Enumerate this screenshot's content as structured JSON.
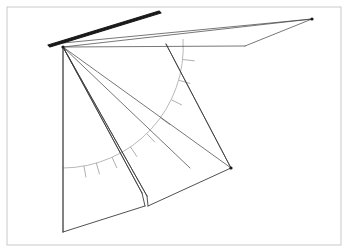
{
  "document": {
    "title": "Perspective line drawing — folded planes with angle arc",
    "width": 348,
    "height": 252,
    "background_color": "#ffffff"
  },
  "frame": {
    "name": "image-border",
    "x": 7,
    "y": 7,
    "width": 334,
    "height": 238,
    "stroke_color": "#c9c9c9",
    "stroke_width": 1,
    "fill": "#ffffff"
  },
  "style": {
    "ink_dark": "#1a1a1a",
    "ink_mid": "#3c3c3c",
    "ink_light": "#8f8f8f",
    "ink_faint": "#b0b0b0",
    "thin_width": 0.7,
    "medium_width": 0.9,
    "thick_width": 1.7
  },
  "geometry": {
    "apex": {
      "name": "apex-vertex",
      "x": 63,
      "y": 47
    },
    "right_vertex": {
      "name": "right-wing-vertex",
      "x": 312,
      "y": 19
    },
    "lower_right_vertex": {
      "name": "lower-right-vertex",
      "x": 231,
      "y": 168
    },
    "bottom_left_vertex": {
      "name": "bottom-left-vertex",
      "x": 63,
      "y": 232
    },
    "rod": {
      "name": "thick-rod",
      "points": "48,45 159,11 161,13 50,47",
      "stroke_color": "#1a1a1a",
      "stroke_width": 1.1
    },
    "upper_wing": {
      "name": "upper-wing-panel",
      "points": "63,47 312,19 245,46 63,43",
      "stroke_color": "#3c3c3c",
      "stroke_width": 0.8
    },
    "upper_wing_extra_edges": [
      {
        "name": "wing-edge-top",
        "x1": 63,
        "y1": 43,
        "x2": 312,
        "y2": 19
      },
      {
        "name": "wing-edge-mid",
        "x1": 63,
        "y1": 47,
        "x2": 312,
        "y2": 19
      },
      {
        "name": "wing-edge-lower",
        "x1": 63,
        "y1": 47,
        "x2": 245,
        "y2": 46
      },
      {
        "name": "wing-edge-bottom",
        "x1": 245,
        "y1": 46,
        "x2": 312,
        "y2": 19
      }
    ],
    "left_panel": {
      "name": "left-vertical-panel",
      "points": "63,47 63,232 145,206 142,193",
      "stroke_color": "#3c3c3c",
      "stroke_width": 0.8
    },
    "left_panel_edges": [
      {
        "name": "left-panel-vertical-edge",
        "x1": 63,
        "y1": 47,
        "x2": 63,
        "y2": 232
      },
      {
        "name": "left-panel-bottom-edge",
        "x1": 63,
        "y1": 232,
        "x2": 145,
        "y2": 206
      },
      {
        "name": "left-panel-notch-edge",
        "x1": 145,
        "y1": 206,
        "x2": 142,
        "y2": 193
      }
    ],
    "fold_panel": {
      "name": "folded-center-panel",
      "points": "63,47 142,193 148,206 231,168",
      "stroke_color": "#3c3c3c",
      "stroke_width": 0.8
    },
    "fold_edges": [
      {
        "name": "fold-edge-left-outer",
        "x1": 63,
        "y1": 47,
        "x2": 142,
        "y2": 193
      },
      {
        "name": "fold-edge-left-inner",
        "x1": 63,
        "y1": 47,
        "x2": 147,
        "y2": 196
      },
      {
        "name": "fold-notch-base",
        "x1": 147,
        "y1": 196,
        "x2": 148,
        "y2": 206
      },
      {
        "name": "fold-edge-bottom",
        "x1": 148,
        "y1": 206,
        "x2": 231,
        "y2": 168
      },
      {
        "name": "fold-edge-right",
        "x1": 231,
        "y1": 168,
        "x2": 166,
        "y2": 44
      }
    ],
    "fan_lines": [
      {
        "name": "fan-line-1",
        "x1": 63,
        "y1": 47,
        "x2": 231,
        "y2": 168
      },
      {
        "name": "fan-line-2",
        "x1": 63,
        "y1": 47,
        "x2": 190,
        "y2": 168
      },
      {
        "name": "fan-line-3",
        "x1": 63,
        "y1": 47,
        "x2": 142,
        "y2": 193
      },
      {
        "name": "fan-line-4",
        "x1": 63,
        "y1": 47,
        "x2": 147,
        "y2": 196
      },
      {
        "name": "fan-line-5",
        "x1": 166,
        "y1": 44,
        "x2": 231,
        "y2": 168
      },
      {
        "name": "fan-line-6",
        "x1": 63,
        "y1": 47,
        "x2": 63,
        "y2": 232
      }
    ],
    "arc": {
      "name": "angle-arc",
      "center_x": 63,
      "center_y": 47,
      "radius": 121,
      "start_angle_deg": -4,
      "end_angle_deg": 82,
      "stroke_color": "#b0b0b0",
      "stroke_width": 0.9,
      "path": "M 183,39 A 121 121 0 0 1 63,168"
    },
    "arc_ticks": {
      "name": "arc-hatch-ticks",
      "count": 9,
      "length": 11,
      "stroke_color": "#9a9a9a",
      "stroke_width": 0.8,
      "angles_deg": [
        6,
        16,
        26,
        36,
        46,
        56,
        66,
        74,
        80
      ]
    }
  },
  "labels": {
    "caption": ""
  }
}
